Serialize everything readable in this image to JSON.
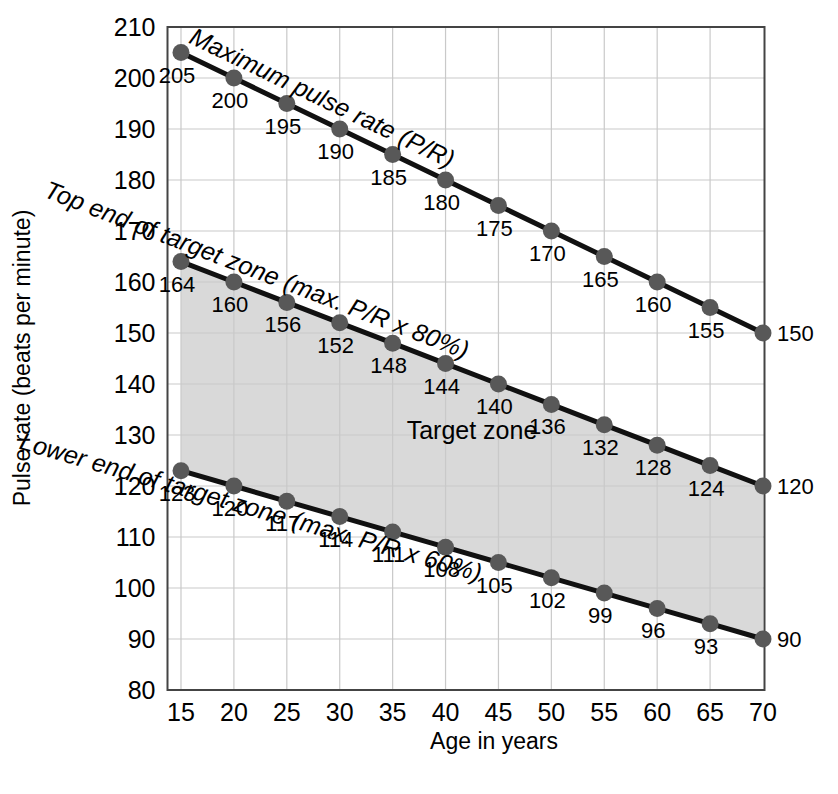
{
  "chart_data": {
    "type": "line",
    "title": "",
    "xlabel": "Age in years",
    "ylabel": "Pulse rate (beats per minute)",
    "xlim": [
      15,
      70
    ],
    "ylim": [
      80,
      210
    ],
    "grid": true,
    "legend_position": "inline",
    "x": [
      15,
      20,
      25,
      30,
      35,
      40,
      45,
      50,
      55,
      60,
      65,
      70
    ],
    "xticklabels": [
      "15",
      "20",
      "25",
      "30",
      "35",
      "40",
      "45",
      "50",
      "55",
      "60",
      "65",
      "70"
    ],
    "yticks": [
      80,
      90,
      100,
      110,
      120,
      130,
      140,
      150,
      160,
      170,
      180,
      190,
      200,
      210
    ],
    "yticklabels": [
      "80",
      "90",
      "100",
      "110",
      "120",
      "130",
      "140",
      "150",
      "160",
      "170",
      "180",
      "190",
      "200",
      "210"
    ],
    "series": [
      {
        "name": "Maximum pulse rate (P/R)",
        "inline_label": "Maximum pulse rate (P/R)",
        "values": [
          205,
          200,
          195,
          190,
          185,
          180,
          175,
          170,
          165,
          160,
          155,
          150
        ],
        "point_labels": [
          "205",
          "200",
          "195",
          "190",
          "185",
          "180",
          "175",
          "170",
          "165",
          "160",
          "155",
          "150"
        ]
      },
      {
        "name": "Top end of target zone (max. P/R x 80%)",
        "inline_label": "Top end of target zone (max. P/R x 80%)",
        "values": [
          164,
          160,
          156,
          152,
          148,
          144,
          140,
          136,
          132,
          128,
          124,
          120
        ],
        "point_labels": [
          "164",
          "160",
          "156",
          "152",
          "148",
          "144",
          "140",
          "136",
          "132",
          "128",
          "124",
          "120"
        ]
      },
      {
        "name": "Lower end of target zone (max. P/R x 60%)",
        "inline_label": "Lower end of target zone (max. P/R x 60%)",
        "values": [
          123,
          120,
          117,
          114,
          111,
          108,
          105,
          102,
          99,
          96,
          93,
          90
        ],
        "point_labels": [
          "123",
          "120",
          "117",
          "114",
          "111",
          "108",
          "105",
          "102",
          "99",
          "96",
          "93",
          "90"
        ]
      }
    ],
    "annotations": [
      {
        "text": "Target zone",
        "x": 42.5,
        "y": 131
      }
    ],
    "colors": {
      "line": "#111111",
      "marker": "#585858",
      "fill": "#d9d9d9",
      "grid": "#c9c9c9",
      "axis": "#444444",
      "text": "#000000",
      "background": "#ffffff"
    }
  }
}
